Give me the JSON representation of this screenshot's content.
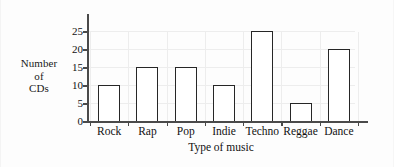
{
  "chart_data": {
    "type": "bar",
    "title": "",
    "categories": [
      "Rock",
      "Rap",
      "Pop",
      "Indie",
      "Techno",
      "Reggae",
      "Dance"
    ],
    "values": [
      10,
      15,
      15,
      10,
      25,
      5,
      20
    ],
    "xlabel": "Type of music",
    "ylabel": "Number of CDs",
    "ylabel_lines": [
      "Number",
      "of",
      "CDs"
    ],
    "ylim": [
      0,
      25
    ],
    "ytick_labels": [
      "0",
      "5",
      "10",
      "15",
      "20",
      "25"
    ],
    "ytick_values": [
      0,
      5,
      10,
      15,
      20,
      25
    ],
    "grid": true,
    "legend": null,
    "bar_style": {
      "fill": "#ffffff",
      "outline": "#262626"
    },
    "axis_color": "#4a4a4a",
    "grid_color": "#ededed",
    "background": "#fdfdfd"
  }
}
